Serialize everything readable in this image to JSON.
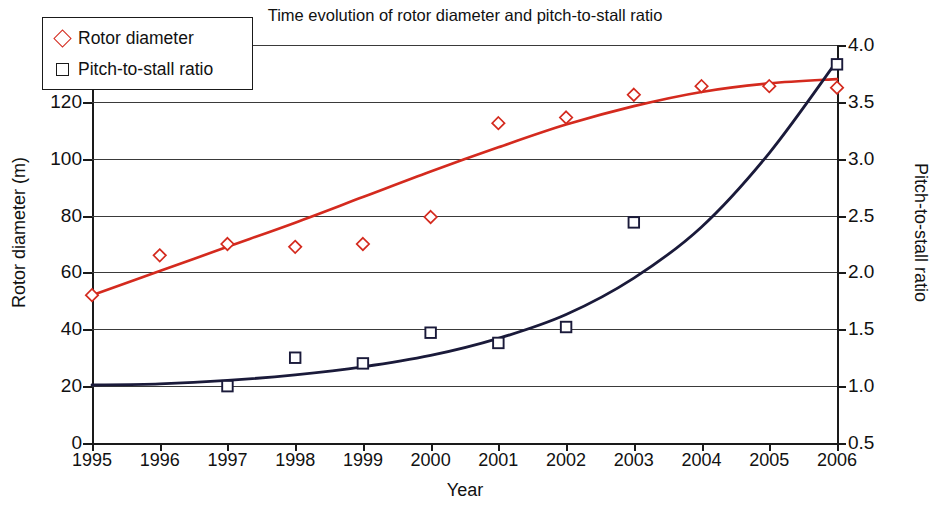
{
  "chart_data": {
    "type": "scatter",
    "title": "Time evolution of rotor diameter and pitch-to-stall ratio",
    "xlabel": "Year",
    "ylabel": "Rotor diameter (m)",
    "y2label": "Pitch-to-stall ratio",
    "grid": true,
    "legend_position": "top-left",
    "x": [
      1995,
      1996,
      1997,
      1998,
      1999,
      2000,
      2001,
      2002,
      2003,
      2004,
      2005,
      2006
    ],
    "xtick_labels": [
      "1995",
      "1996",
      "1997",
      "1998",
      "1999",
      "2000",
      "2001",
      "2002",
      "2003",
      "2004",
      "2005",
      "2006"
    ],
    "xlim": [
      1995,
      2006
    ],
    "ylim": [
      0,
      140
    ],
    "ytick_labels": [
      "0",
      "20",
      "40",
      "60",
      "80",
      "100",
      "120",
      "140"
    ],
    "yticks": [
      0,
      20,
      40,
      60,
      80,
      100,
      120,
      140
    ],
    "y2lim": [
      0.5,
      4.0
    ],
    "y2tick_labels": [
      "0.5",
      "1.0",
      "1.5",
      "2.0",
      "2.5",
      "3.0",
      "3.5",
      "4.0"
    ],
    "y2ticks": [
      0.5,
      1.0,
      1.5,
      2.0,
      2.5,
      3.0,
      3.5,
      4.0
    ],
    "series": [
      {
        "name": "Rotor diameter",
        "axis": "left",
        "marker": "diamond",
        "color": "#d42a1e",
        "x": [
          1995,
          1996,
          1997,
          1998,
          1999,
          2000,
          2001,
          2002,
          2003,
          2004,
          2005,
          2006
        ],
        "values": [
          52,
          66,
          70,
          69,
          70,
          79.5,
          112.5,
          114.5,
          122.5,
          125.5,
          125.5,
          125
        ],
        "trend": {
          "x": [
            1995,
            1996,
            1997,
            1998,
            1999,
            2000,
            2001,
            2002,
            2003,
            2004,
            2005,
            2006
          ],
          "values": [
            52,
            60.5,
            69,
            77.5,
            86.5,
            95.5,
            104,
            112,
            118.5,
            123.5,
            126.5,
            128
          ]
        }
      },
      {
        "name": "Pitch-to-stall ratio",
        "axis": "right",
        "marker": "square",
        "color": "#1a1a3a",
        "x": [
          1997,
          1998,
          1999,
          2000,
          2001,
          2002,
          2003,
          2006
        ],
        "values": [
          1.0,
          1.25,
          1.2,
          1.47,
          1.38,
          1.52,
          2.44,
          3.83
        ],
        "trend": {
          "x": [
            1995,
            1996,
            1997,
            1998,
            1999,
            2000,
            2001,
            2002,
            2003,
            2004,
            2005,
            2006
          ],
          "values": [
            1.01,
            1.02,
            1.05,
            1.1,
            1.17,
            1.27,
            1.42,
            1.63,
            1.95,
            2.4,
            3.05,
            3.86
          ]
        }
      }
    ]
  },
  "legend": {
    "items": [
      {
        "label": "Rotor diameter",
        "marker": "diamond",
        "color": "#d42a1e"
      },
      {
        "label": "Pitch-to-stall ratio",
        "marker": "square",
        "color": "#1a1a3a"
      }
    ]
  },
  "colors": {
    "rotor_diameter_line": "#d42a1e",
    "pitch_to_stall_line": "#1a1a3a",
    "axis": "#1a1a1a",
    "grid": "#3a3a3a",
    "background": "#ffffff"
  }
}
